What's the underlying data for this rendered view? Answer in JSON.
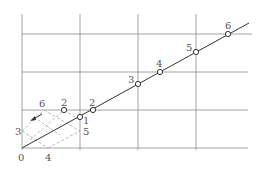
{
  "diagram": {
    "type": "grid-with-diagonal-line",
    "origin_label": "0",
    "x_axis_label": "4",
    "y_axis_label": "3",
    "dashed_region_labels": {
      "top": "6",
      "right": "5"
    },
    "points": [
      {
        "label": "1",
        "on_line": true
      },
      {
        "label": "2",
        "on_line": true
      },
      {
        "label": "2",
        "on_line": false
      },
      {
        "label": "3",
        "on_line": true
      },
      {
        "label": "4",
        "on_line": true
      },
      {
        "label": "5",
        "on_line": true
      },
      {
        "label": "6",
        "on_line": true
      }
    ],
    "colors": {
      "grid": "#8a8a8a",
      "line": "#333333",
      "dashed": "#9a9a9a",
      "text": "#555555"
    }
  }
}
